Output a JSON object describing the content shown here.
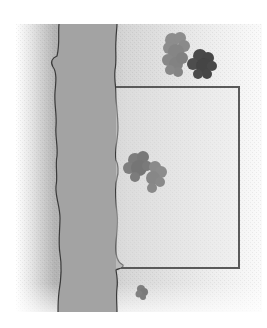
{
  "map": {
    "description": "Grayscale site sketch: a vertical strip (river/road) with wavy banks on the left, a rectangular plot outline to its right, and shrub/tree clusters.",
    "colors": {
      "background": "#ffffff",
      "ground_light": "#f2f2f2",
      "ground_mid": "#d8d8d8",
      "ground_shadow": "#a9a9a9",
      "strip_fill": "#a3a3a3",
      "line": "#3a3a3a",
      "rect_outline": "#5a5a5a",
      "shrub_light": "#8d8d8d",
      "shrub_mid": "#7b7b7b",
      "shrub_dark": "#4a4a4a"
    },
    "features": [
      {
        "name": "strip",
        "type": "river-or-road"
      },
      {
        "name": "plot",
        "type": "rectangle"
      },
      {
        "name": "shrub-cluster-top-light",
        "type": "vegetation"
      },
      {
        "name": "shrub-cluster-top-dark",
        "type": "vegetation"
      },
      {
        "name": "shrub-cluster-middle",
        "type": "vegetation"
      },
      {
        "name": "shrub-small-bottom",
        "type": "vegetation"
      }
    ]
  }
}
